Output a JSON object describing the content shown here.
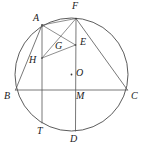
{
  "figure": {
    "background_color": "#ffffff",
    "stroke_color": "#555555",
    "label_color": "#1a1a1a",
    "canvas": {
      "width": 144,
      "height": 150
    }
  },
  "circle": {
    "name": "circumcircle",
    "center": {
      "x": 71.5,
      "y": 74.5
    },
    "radius": 56.5,
    "center_label": "O"
  },
  "points": [
    {
      "id": "A",
      "label": "A",
      "x": 42,
      "y": 25,
      "label_x": 33,
      "label_y": 14,
      "on_circle": true
    },
    {
      "id": "F",
      "label": "F",
      "x": 76,
      "y": 18.5,
      "label_x": 72,
      "label_y": 2,
      "on_circle": true
    },
    {
      "id": "E",
      "label": "E",
      "x": 75.5,
      "y": 45,
      "label_x": 80,
      "label_y": 38,
      "on_circle": false
    },
    {
      "id": "G",
      "label": "G",
      "x": 60,
      "y": 48,
      "label_x": 56,
      "label_y": 42,
      "on_circle": false
    },
    {
      "id": "H",
      "label": "H",
      "x": 42,
      "y": 58,
      "label_x": 30,
      "label_y": 58,
      "on_circle": false
    },
    {
      "id": "O",
      "label": "O",
      "x": 71.5,
      "y": 74.5,
      "label_x": 76,
      "label_y": 68,
      "on_circle": false
    },
    {
      "id": "B",
      "label": "B",
      "x": 15.5,
      "y": 90,
      "label_x": 5,
      "label_y": 91,
      "on_circle": true
    },
    {
      "id": "M",
      "label": "M",
      "x": 75.5,
      "y": 90,
      "label_x": 76,
      "label_y": 91,
      "on_circle": false
    },
    {
      "id": "C",
      "label": "C",
      "x": 127.5,
      "y": 90,
      "label_x": 131,
      "label_y": 91,
      "on_circle": true
    },
    {
      "id": "T",
      "label": "T",
      "x": 42,
      "y": 123,
      "label_x": 38,
      "label_y": 127,
      "on_circle": true
    },
    {
      "id": "D",
      "label": "D",
      "x": 75.5,
      "y": 131,
      "label_x": 71,
      "label_y": 134,
      "on_circle": true
    }
  ],
  "segments": [
    {
      "id": "BC",
      "name": "chord-b-c",
      "from": "B",
      "to": "C"
    },
    {
      "id": "FD",
      "name": "chord-f-d",
      "from": "F",
      "to": "D"
    },
    {
      "id": "AT",
      "name": "chord-a-t",
      "from": "A",
      "to": "T"
    },
    {
      "id": "AB",
      "name": "chord-a-b",
      "from": "A",
      "to": "B"
    },
    {
      "id": "AF",
      "name": "chord-a-f",
      "from": "A",
      "to": "F"
    },
    {
      "id": "AE",
      "name": "segment-a-e",
      "from": "A",
      "to": "E"
    },
    {
      "id": "FH",
      "name": "segment-f-h",
      "from": "F",
      "to": "H"
    },
    {
      "id": "EH",
      "name": "segment-e-h",
      "from": "E",
      "to": "H"
    },
    {
      "id": "FC",
      "name": "chord-f-c",
      "from": "F",
      "to": "C"
    }
  ],
  "intersections": {
    "G_note": "G is the intersection of AE and FH",
    "M_note": "M is the intersection of FD and BC",
    "O_note": "O is the centre of the circle"
  }
}
